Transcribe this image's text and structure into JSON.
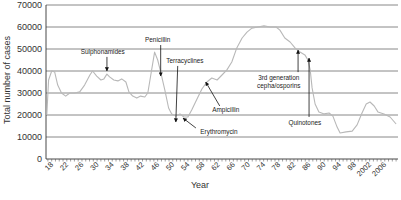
{
  "chart_data": {
    "type": "line",
    "title": "",
    "xlabel": "Year",
    "ylabel": "Total number of cases",
    "xlim": [
      1916.5,
      2009.5
    ],
    "ylim": [
      0,
      70000
    ],
    "grid": true,
    "legend": null,
    "y_ticks": [
      0,
      10000,
      20000,
      30000,
      40000,
      50000,
      60000,
      70000
    ],
    "y_tick_labels": [
      "0",
      "10000",
      "20000",
      "30000",
      "40000",
      "50000",
      "60000",
      "70000"
    ],
    "x_ticks": [
      1918,
      1922,
      1926,
      1930,
      1934,
      1938,
      1942,
      1946,
      1950,
      1954,
      1958,
      1962,
      1966,
      1970,
      1974,
      1978,
      1982,
      1986,
      1990,
      1994,
      1998,
      2002,
      2006
    ],
    "x_tick_labels": [
      "18",
      "22",
      "26",
      "30",
      "34",
      "38",
      "42",
      "46",
      "50",
      "54",
      "58",
      "62",
      "66",
      "70",
      "74",
      "78",
      "82",
      "86",
      "90",
      "94",
      "98",
      "2002",
      "2006"
    ],
    "series": [
      {
        "name": "Total number of cases",
        "color": "#b8b8b8",
        "x": [
          1916.7,
          1917.2,
          1918,
          1918.8,
          1919.6,
          1920.6,
          1921.7,
          1922.8,
          1924.1,
          1925.4,
          1926.7,
          1928.1,
          1928.8,
          1929.9,
          1931,
          1931.8,
          1932.6,
          1933.3,
          1934.4,
          1935.5,
          1936.5,
          1937.6,
          1938.4,
          1939.4,
          1940.5,
          1941.5,
          1942.6,
          1943.4,
          1944.2,
          1945.2,
          1946,
          1946.8,
          1947.9,
          1948.9,
          1949.7,
          1950.8,
          1951.9,
          1952.9,
          1954,
          1955,
          1956.4,
          1957.7,
          1959,
          1960.3,
          1961.7,
          1963,
          1964.3,
          1965.6,
          1966.9,
          1968.3,
          1969.6,
          1970.9,
          1972.5,
          1974.1,
          1975.7,
          1977.3,
          1978.3,
          1979.6,
          1981,
          1982.3,
          1983.6,
          1984.9,
          1985.7,
          1986.3,
          1986.8,
          1987.6,
          1988.6,
          1990,
          1991.3,
          1992.3,
          1993.4,
          1994.2,
          1995.8,
          1997.4,
          1998.7,
          2000,
          2001.1,
          2002.1,
          2003.2,
          2004.2,
          2005.8,
          2007.4,
          2009
        ],
        "values": [
          20000,
          35900,
          40000,
          39500,
          33600,
          30000,
          28600,
          30000,
          30000,
          30500,
          33600,
          38200,
          40000,
          37700,
          35900,
          36400,
          38600,
          37300,
          35900,
          35500,
          36400,
          35000,
          30500,
          28600,
          27700,
          28600,
          28200,
          30000,
          38200,
          48600,
          45000,
          39500,
          31400,
          23200,
          20500,
          19500,
          20500,
          19100,
          19100,
          22300,
          27300,
          31800,
          35000,
          36800,
          35900,
          38200,
          40500,
          44100,
          50500,
          55000,
          57700,
          59500,
          60000,
          60500,
          60000,
          60000,
          58600,
          55000,
          53200,
          50500,
          48600,
          47300,
          45000,
          40500,
          32300,
          25000,
          21400,
          20500,
          20900,
          19500,
          14500,
          11800,
          12300,
          12700,
          15500,
          20900,
          25000,
          25900,
          24100,
          21400,
          20500,
          19100,
          15900
        ]
      }
    ],
    "annotations": [
      {
        "lines": [
          "Sulphonamides"
        ],
        "label_at": [
          1931.5,
          48600
        ],
        "arrow_from": [
          1932.6,
          46400
        ],
        "arrow_to": [
          1932.6,
          40000
        ]
      },
      {
        "lines": [
          "Penicillin"
        ],
        "label_at": [
          1946,
          54100
        ],
        "arrow_from": [
          1946.8,
          51800
        ],
        "arrow_to": [
          1946.8,
          37700
        ]
      },
      {
        "lines": [
          "Terracyclines"
        ],
        "label_at": [
          1953.2,
          44500
        ],
        "arrow_from": [
          1951.3,
          42300
        ],
        "arrow_to": [
          1950.8,
          16800
        ]
      },
      {
        "lines": [
          "Ampicillin"
        ],
        "label_at": [
          1964,
          22300
        ],
        "arrow_from": [
          1962.4,
          24100
        ],
        "arrow_to": [
          1958.7,
          35000
        ]
      },
      {
        "lines": [
          "Erythromycin"
        ],
        "label_at": [
          1962.2,
          12300
        ],
        "arrow_from": [
          1956.1,
          14100
        ],
        "arrow_to": [
          1952.7,
          18600
        ]
      },
      {
        "lines": [
          "3rd generation",
          "cepha/osporins"
        ],
        "label_at": [
          1978,
          36800
        ],
        "arrow_from": [
          1983.1,
          39500
        ],
        "arrow_to": [
          1983.1,
          49500
        ]
      },
      {
        "lines": [
          "Quinotones"
        ],
        "label_at": [
          1984.9,
          16400
        ],
        "arrow_from": [
          1986,
          19100
        ],
        "arrow_to": [
          1986,
          45900
        ]
      }
    ]
  }
}
